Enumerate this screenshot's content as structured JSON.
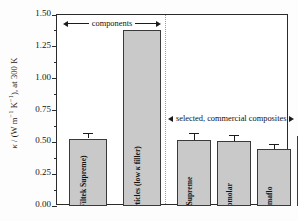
{
  "chart_data": {
    "type": "bar",
    "title": "",
    "xlabel": "",
    "ylabel_text": "κ / (W m⁻¹ K⁻¹), at 300 K",
    "ylabel_parts": {
      "kappa": "κ",
      "slash": " / (W m",
      "sup1": "-1",
      "mid": " K",
      "sup2": "-1",
      "tail": "), at 300 K"
    },
    "ylim": [
      0.0,
      1.5
    ],
    "ytick_labels": [
      "0.00",
      "0.25",
      "0.50",
      "0.75",
      "1.00",
      "1.25",
      "1.50"
    ],
    "ytick_values": [
      0.0,
      0.25,
      0.5,
      0.75,
      1.0,
      1.25,
      1.5
    ],
    "grid": false,
    "legend": "none",
    "categories": [
      "Blank resin (Filtek Supreme)",
      "a-SiO2 filler particles (low κ filler)",
      "Filtek Supreme",
      "Heliomolar",
      "Permaflo",
      "Vit-l-escence"
    ],
    "values": [
      0.53,
      1.38,
      0.52,
      0.51,
      0.45,
      0.55
    ],
    "errors": [
      0.04,
      0.0,
      0.05,
      0.05,
      0.04,
      0.06
    ],
    "bar_color": "#c9c9c9",
    "bar_edge_color": "#3a3a3a",
    "frame_color": "#2b2b2b",
    "divider_color": "#9a9a9a"
  },
  "bars": [
    {
      "id": "blank-resin",
      "label_line1": "Blank resin",
      "label_line2": "(Filtek Supreme)",
      "value": 0.53,
      "error": 0.04,
      "group": "components"
    },
    {
      "id": "a-sio2-filler",
      "label_line1": "a-SiO",
      "label_sub": "2",
      "label_line1b": " filler particles (low ",
      "label_kappa": "κ",
      "label_line1c": " filler)",
      "value": 1.38,
      "error": 0.0,
      "group": "components"
    },
    {
      "id": "filtek-supreme",
      "label_line1": "Filtek Supreme",
      "value": 0.52,
      "error": 0.05,
      "group": "composites"
    },
    {
      "id": "heliomolar",
      "label_line1": "Heliomolar",
      "value": 0.51,
      "error": 0.05,
      "group": "composites"
    },
    {
      "id": "permaflo",
      "label_line1": "Permaflo",
      "value": 0.45,
      "error": 0.04,
      "group": "composites"
    },
    {
      "id": "vit-l-escence",
      "label_line1": "Vit-l-escence",
      "value": 0.55,
      "error": 0.06,
      "group": "composites"
    }
  ],
  "annotations": {
    "components": "components",
    "composites": "selected, commercial composites"
  }
}
